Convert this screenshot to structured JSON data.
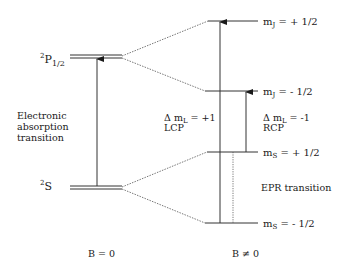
{
  "diagram": {
    "colors": {
      "line": "#2a2a2a",
      "dashed": "#555555",
      "background": "#ffffff"
    },
    "levels_b0": [
      {
        "term": "P",
        "superscript": "2",
        "subscript": "1/2"
      },
      {
        "term": "S",
        "superscript": "2",
        "subscript": ""
      }
    ],
    "levels_b": [
      {
        "symbol": "m",
        "sub": "J",
        "value": " = + 1/2"
      },
      {
        "symbol": "m",
        "sub": "J",
        "value": " = - 1/2"
      },
      {
        "symbol": "m",
        "sub": "S",
        "value": " = + 1/2"
      },
      {
        "symbol": "m",
        "sub": "S",
        "value": " = - 1/2"
      }
    ],
    "annotations": {
      "absorption_line1": "Electronic",
      "absorption_line2": "absorption",
      "absorption_line3": "transition",
      "lcp_delta": "Δ m",
      "lcp_sub": "L",
      "lcp_value": " = +1",
      "lcp_label": "LCP",
      "rcp_delta": "Δ m",
      "rcp_sub": "L",
      "rcp_value": " = -1",
      "rcp_label": "RCP",
      "epr": "EPR transition"
    },
    "axis_labels": {
      "b_zero": "B = 0",
      "b_nonzero": "B ≠ 0"
    }
  }
}
